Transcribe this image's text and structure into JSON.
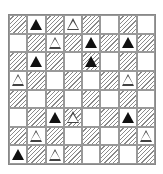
{
  "board": {
    "rows": 8,
    "cols": 8,
    "legend": {
      "H": "hatched cell",
      "W": "white cell",
      "B": "black triangle",
      "O": "white (outlined) triangle"
    },
    "cells": [
      [
        [
          "H",
          ""
        ],
        [
          "W",
          "B"
        ],
        [
          "H",
          ""
        ],
        [
          "W",
          "O"
        ],
        [
          "H",
          ""
        ],
        [
          "W",
          ""
        ],
        [
          "H",
          ""
        ],
        [
          "W",
          ""
        ]
      ],
      [
        [
          "W",
          ""
        ],
        [
          "H",
          ""
        ],
        [
          "W",
          "O"
        ],
        [
          "H",
          ""
        ],
        [
          "W",
          "B"
        ],
        [
          "H",
          ""
        ],
        [
          "W",
          "B"
        ],
        [
          "H",
          ""
        ]
      ],
      [
        [
          "H",
          ""
        ],
        [
          "W",
          "B"
        ],
        [
          "H",
          ""
        ],
        [
          "W",
          ""
        ],
        [
          "H",
          "B"
        ],
        [
          "W",
          ""
        ],
        [
          "H",
          ""
        ],
        [
          "W",
          ""
        ]
      ],
      [
        [
          "W",
          "O"
        ],
        [
          "H",
          ""
        ],
        [
          "W",
          ""
        ],
        [
          "H",
          ""
        ],
        [
          "W",
          ""
        ],
        [
          "H",
          ""
        ],
        [
          "W",
          "O"
        ],
        [
          "H",
          ""
        ]
      ],
      [
        [
          "H",
          ""
        ],
        [
          "W",
          ""
        ],
        [
          "H",
          ""
        ],
        [
          "W",
          ""
        ],
        [
          "H",
          ""
        ],
        [
          "W",
          ""
        ],
        [
          "H",
          ""
        ],
        [
          "W",
          ""
        ]
      ],
      [
        [
          "W",
          ""
        ],
        [
          "H",
          ""
        ],
        [
          "W",
          "B"
        ],
        [
          "H",
          "O"
        ],
        [
          "W",
          ""
        ],
        [
          "H",
          ""
        ],
        [
          "W",
          "B"
        ],
        [
          "H",
          ""
        ]
      ],
      [
        [
          "H",
          ""
        ],
        [
          "W",
          "O"
        ],
        [
          "H",
          ""
        ],
        [
          "W",
          ""
        ],
        [
          "H",
          ""
        ],
        [
          "W",
          ""
        ],
        [
          "H",
          ""
        ],
        [
          "W",
          "O"
        ]
      ],
      [
        [
          "W",
          "B"
        ],
        [
          "H",
          ""
        ],
        [
          "W",
          "O"
        ],
        [
          "H",
          ""
        ],
        [
          "W",
          ""
        ],
        [
          "H",
          ""
        ],
        [
          "W",
          ""
        ],
        [
          "H",
          ""
        ]
      ]
    ]
  },
  "colors": {
    "hatch": "#8a8a8a",
    "black_triangle": "#111111",
    "grid_line": "#999999"
  }
}
